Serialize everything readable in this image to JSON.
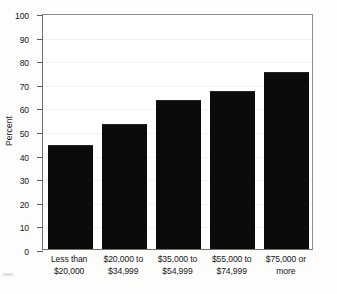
{
  "chart_data": {
    "type": "bar",
    "title": "",
    "subtitle": "",
    "xlabel": "",
    "ylabel": "Percent",
    "ylim": [
      0,
      100
    ],
    "yticks": [
      0,
      10,
      20,
      30,
      40,
      50,
      60,
      70,
      80,
      90,
      100
    ],
    "ytick_labels": [
      "0",
      "10",
      "20",
      "30",
      "40",
      "50",
      "60",
      "70",
      "80",
      "90",
      "100"
    ],
    "grid": false,
    "legend": null,
    "legend_position": "none",
    "bar_color": "#0b0b0b",
    "categories": [
      "Less than\n$20,000",
      "$20,000 to\n$34,999",
      "$35,000 to\n$54,999",
      "$55,000 to\n$74,999",
      "$75,000 or\nmore"
    ],
    "category_lines": [
      [
        "Less than",
        "$20,000"
      ],
      [
        "$20,000 to",
        "$34,999"
      ],
      [
        "$35,000 to",
        "$54,999"
      ],
      [
        "$55,000 to",
        "$74,999"
      ],
      [
        "$75,000 or",
        "more"
      ]
    ],
    "values": [
      44,
      53,
      63,
      67,
      75
    ],
    "annotations": []
  }
}
